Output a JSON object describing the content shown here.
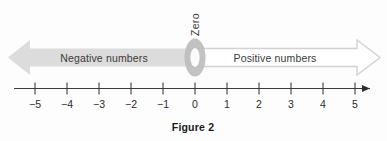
{
  "figure": {
    "caption": "Figure 2",
    "zero_label": "Zero",
    "negative_band_label": "Negative numbers",
    "positive_band_label": "Positive numbers"
  },
  "colors": {
    "negative_arrow_fill": "#dcdcdc",
    "positive_arrow_fill": "#ffffff",
    "positive_arrow_stroke": "#d2d2d2",
    "zero_ring_fill": "#b8b8b8",
    "axis_line": "#3c3c3c",
    "text": "#2b2b2b",
    "background": "#fdfdfd"
  },
  "chart_data": {
    "type": "line",
    "title": "Figure 2",
    "xlabel": "",
    "ylabel": "",
    "grid": false,
    "legend": "none",
    "axis_orientation": "horizontal",
    "xlim": [
      -5,
      5
    ],
    "tick_values": [
      -5,
      -4,
      -3,
      -2,
      -1,
      0,
      1,
      2,
      3,
      4,
      5
    ],
    "tick_labels": [
      "−5",
      "−4",
      "−3",
      "−2",
      "−1",
      "0",
      "1",
      "2",
      "3",
      "4",
      "5"
    ],
    "annotations": [
      {
        "text": "Negative numbers",
        "range": [
          -5,
          0
        ],
        "style": "filled-left-arrow"
      },
      {
        "text": "Zero",
        "at": 0,
        "style": "ring-marker-rotated-label"
      },
      {
        "text": "Positive numbers",
        "range": [
          0,
          5
        ],
        "style": "outline-right-arrow"
      }
    ],
    "axis_arrow_ends": [
      "right"
    ]
  },
  "ticks": [
    {
      "label": "−5",
      "x": 35
    },
    {
      "label": "−4",
      "x": 67
    },
    {
      "label": "−3",
      "x": 99
    },
    {
      "label": "−2",
      "x": 131
    },
    {
      "label": "−1",
      "x": 163
    },
    {
      "label": "0",
      "x": 195
    },
    {
      "label": "1",
      "x": 227
    },
    {
      "label": "2",
      "x": 259
    },
    {
      "label": "3",
      "x": 291
    },
    {
      "label": "4",
      "x": 323
    },
    {
      "label": "5",
      "x": 355
    }
  ]
}
